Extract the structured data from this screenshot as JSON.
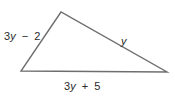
{
  "figure": {
    "shape": "triangle",
    "stroke_color": "#6e6e6e",
    "sides": {
      "left": {
        "coef": "3",
        "variable": "y",
        "operator": "−",
        "constant": "2"
      },
      "right": {
        "variable": "y"
      },
      "bottom": {
        "coef": "3",
        "variable": "y",
        "operator": "+",
        "constant": "5"
      }
    }
  }
}
